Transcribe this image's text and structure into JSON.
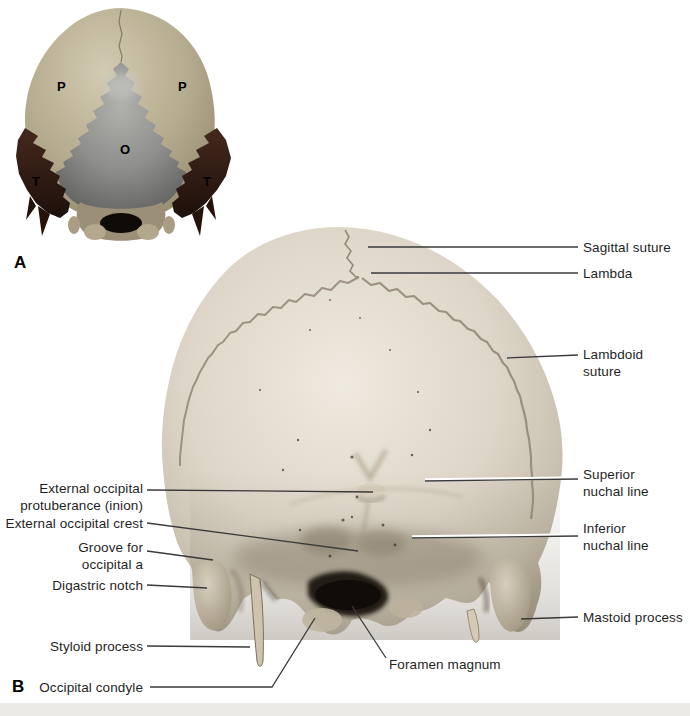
{
  "figure_labels": {
    "panel_a": "A",
    "panel_b": "B"
  },
  "panel_a": {
    "description": "color-coded posterior skull diagram",
    "bone_letters": [
      {
        "id": "parietal-left",
        "letter": "P"
      },
      {
        "id": "parietal-right",
        "letter": "P"
      },
      {
        "id": "occipital",
        "letter": "O"
      },
      {
        "id": "temporal-left",
        "letter": "T"
      },
      {
        "id": "temporal-right",
        "letter": "T"
      }
    ],
    "colors": {
      "parietal": "#b5ab8e",
      "occipital": "#8e8e8c",
      "temporal": "#2e1c14"
    }
  },
  "panel_b": {
    "description": "posterior view skull photograph",
    "bone_color": "#ddd6c9",
    "labels": [
      {
        "id": "sagittal-suture",
        "text": "Sagittal suture"
      },
      {
        "id": "lambda",
        "text": "Lambda"
      },
      {
        "id": "lambdoid-suture",
        "text": "Lambdoid suture"
      },
      {
        "id": "superior-nuchal-line",
        "text": "Superior nuchal line"
      },
      {
        "id": "inferior-nuchal-line",
        "text": "Inferior nuchal line"
      },
      {
        "id": "mastoid-process",
        "text": "Mastoid process"
      },
      {
        "id": "external-occipital-protuberance",
        "text": "External occipital protuberance (inion)"
      },
      {
        "id": "external-occipital-crest",
        "text": "External occipital crest"
      },
      {
        "id": "groove-for-occipital-a",
        "text": "Groove for occipital a"
      },
      {
        "id": "digastric-notch",
        "text": "Digastric notch"
      },
      {
        "id": "styloid-process",
        "text": "Styloid process"
      },
      {
        "id": "foramen-magnum",
        "text": "Foramen magnum"
      },
      {
        "id": "occipital-condyle",
        "text": "Occipital condyle"
      }
    ]
  }
}
